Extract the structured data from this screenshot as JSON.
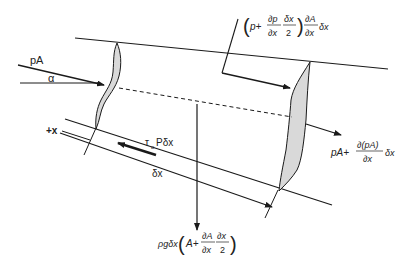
{
  "diagram": {
    "labels": {
      "inlet_force": "pA",
      "angle": "α",
      "direction": "+x",
      "shear_force": "τ",
      "shear_sub": "o",
      "shear_rest": "Pδx",
      "length": "δx",
      "outlet_force_main": "pA+",
      "outlet_force_num": "∂(pA)",
      "outlet_force_den": "∂x",
      "outlet_force_tail": "δx",
      "wall_pressure_open": "p+",
      "wall_pressure_frac1_num": "∂p",
      "wall_pressure_frac1_den": "∂x",
      "wall_pressure_frac2_num": "δx",
      "wall_pressure_frac2_den": "2",
      "wall_pressure_frac3_num": "∂A",
      "wall_pressure_frac3_den": "∂x",
      "wall_pressure_tail": "δx",
      "weight_prefix": "ρgδx",
      "weight_A": "A+",
      "weight_frac1_num": "∂A",
      "weight_frac1_den": "∂x",
      "weight_frac2_num": "∂x",
      "weight_frac2_den": "2"
    },
    "colors": {
      "stroke": "#1a1a1a",
      "section_fill": "#d9d9d9",
      "text": "#222222"
    }
  }
}
